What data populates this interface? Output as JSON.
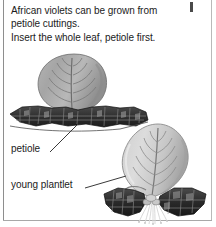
{
  "figure": {
    "caption": {
      "line1": "African violets can be grown from",
      "line2": "petiole cuttings.",
      "line3": "Insert the whole leaf, petiole first."
    },
    "labels": {
      "petiole": "petiole",
      "young_plantlet": "young plantlet"
    },
    "illustrations": [
      {
        "name": "upper-cutting",
        "description": "Whole African violet leaf inserted petiole-first into a bed of soil"
      },
      {
        "name": "lower-cutting",
        "description": "Rooted African violet leaf cutting with roots and young plantlets at its base"
      }
    ],
    "colors": {
      "text": "#1b1b1b",
      "page_background": "#ffffff",
      "leaf_light": "#d8d8d8",
      "leaf_mid": "#a9a9a9",
      "leaf_dark": "#7d7d7d",
      "vein": "#6b6b6b",
      "soil_dark": "#2b2b2b",
      "soil_mid": "#4f4f4f",
      "root": "#e8e8e8",
      "leader_line": "#3a3a3a",
      "frame": "#8e8e8e"
    }
  }
}
